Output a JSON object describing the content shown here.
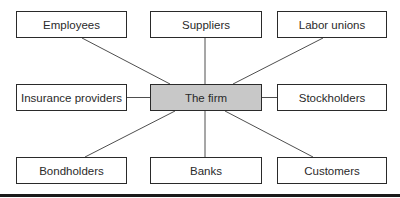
{
  "diagram": {
    "type": "hub-and-spoke stakeholder diagram",
    "center": {
      "id": "firm",
      "label": "The firm",
      "fill": "#c8c8c8"
    },
    "nodes": [
      {
        "id": "employees",
        "label": "Employees",
        "position": "top-left"
      },
      {
        "id": "suppliers",
        "label": "Suppliers",
        "position": "top-center"
      },
      {
        "id": "labor-unions",
        "label": "Labor unions",
        "position": "top-right"
      },
      {
        "id": "insurance-providers",
        "label": "Insurance providers",
        "position": "middle-left"
      },
      {
        "id": "stockholders",
        "label": "Stockholders",
        "position": "middle-right"
      },
      {
        "id": "bondholders",
        "label": "Bondholders",
        "position": "bottom-left"
      },
      {
        "id": "banks",
        "label": "Banks",
        "position": "bottom-center"
      },
      {
        "id": "customers",
        "label": "Customers",
        "position": "bottom-right"
      }
    ],
    "edges": [
      {
        "from": "firm",
        "to": "employees"
      },
      {
        "from": "firm",
        "to": "suppliers"
      },
      {
        "from": "firm",
        "to": "labor-unions"
      },
      {
        "from": "firm",
        "to": "insurance-providers"
      },
      {
        "from": "firm",
        "to": "stockholders"
      },
      {
        "from": "firm",
        "to": "bondholders"
      },
      {
        "from": "firm",
        "to": "banks"
      },
      {
        "from": "firm",
        "to": "customers"
      }
    ],
    "colors": {
      "stroke": "#2a2a2a",
      "node_fill": "#ffffff",
      "center_fill": "#c8c8c8",
      "text": "#2a2a2a"
    }
  }
}
